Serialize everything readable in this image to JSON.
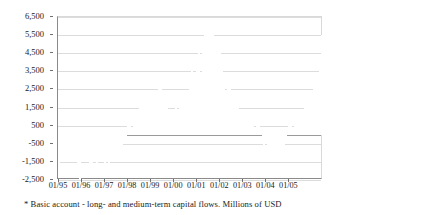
{
  "footnote": "* Basic account - long- and medium-term capital flows. Millions of USD",
  "chart_data": {
    "type": "bar",
    "title": "",
    "subtitle": "",
    "xlabel": "",
    "ylabel": "",
    "ylim": [
      -2500,
      6500
    ],
    "grid": true,
    "legend": "none",
    "bar_color": "#808080",
    "zero_line": 0,
    "ytick_labels": [
      "6,500",
      "5,500",
      "4,500",
      "3,500",
      "2,500",
      "1,500",
      "500",
      "-500",
      "-1,500",
      "-2,500"
    ],
    "yticks": [
      6500,
      5500,
      4500,
      3500,
      2500,
      1500,
      500,
      -500,
      -1500,
      -2500
    ],
    "xtick_labels": [
      "01/95",
      "01/96",
      "01/97",
      "01/98",
      "01/99",
      "01/00",
      "01/01",
      "01/02",
      "01/03",
      "01/04",
      "01/05"
    ],
    "xtick_index": [
      0,
      12,
      24,
      36,
      48,
      60,
      72,
      84,
      96,
      108,
      120
    ],
    "series": [
      {
        "name": "Basic account",
        "values": [
          -2250,
          -1100,
          -1350,
          -1500,
          -1250,
          -1200,
          -1300,
          -1200,
          -1100,
          -1200,
          -2300,
          -2500,
          -1450,
          -1150,
          -1200,
          -1150,
          -1900,
          -2200,
          -1300,
          -1250,
          -2300,
          -1500,
          -1200,
          -1250,
          -1750,
          -1200,
          -1600,
          -1300,
          -1150,
          -1150,
          -1100,
          -950,
          -900,
          -700,
          -500,
          -350,
          800,
          900,
          400,
          1100,
          1200,
          1350,
          1500,
          1600,
          1700,
          1550,
          1800,
          1900,
          2100,
          2250,
          2350,
          2150,
          2500,
          2900,
          2400,
          2000,
          1700,
          1400,
          1250,
          1200,
          1300,
          1500,
          1350,
          1450,
          1500,
          1900,
          1500,
          1550,
          2800,
          3600,
          3000,
          2950,
          4100,
          4800,
          3300,
          5000,
          5600,
          6450,
          5700,
          6400,
          6350,
          5200,
          4900,
          5400,
          4500,
          3800,
          2900,
          2400,
          2900,
          2500,
          2400,
          2100,
          1800,
          1700,
          1100,
          1050,
          1200,
          750,
          800,
          1100,
          700,
          1050,
          400,
          650,
          550,
          150,
          -450,
          -650,
          -400,
          -800,
          -700,
          -900,
          -900,
          -950,
          -1400,
          -900,
          -700,
          -550,
          -350,
          200,
          700,
          950,
          250,
          1100,
          950,
          750,
          1400,
          1300,
          1900,
          2100,
          2350,
          2300,
          2400,
          3200,
          2900,
          2800,
          4300,
          5500
        ]
      }
    ],
    "n_points": 126
  }
}
